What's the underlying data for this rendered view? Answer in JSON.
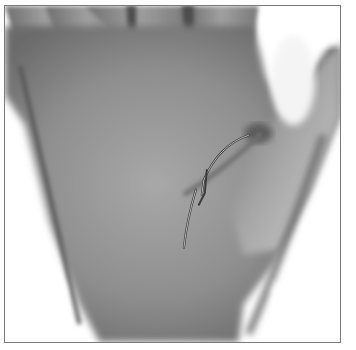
{
  "image": {
    "subject": "palm of a hand (grayscale photograph)",
    "annotations": [
      {
        "label": "traced crease line (upper arc)"
      },
      {
        "label": "traced crease line (lower segment)"
      }
    ],
    "colors": {
      "skin_dark": "#5a5a5a",
      "skin_mid": "#8c8c8c",
      "skin_light": "#b4b4b4",
      "background": "#ffffff",
      "frame_border": "#7a7a7a"
    }
  }
}
